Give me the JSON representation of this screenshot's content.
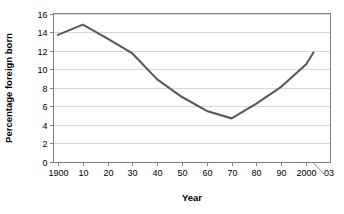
{
  "chart_data": {
    "type": "line",
    "title": "",
    "xlabel": "Year",
    "ylabel": "Percentage foreign born",
    "xlim": [
      1900,
      2003
    ],
    "ylim": [
      0,
      16
    ],
    "grid": "horizontal",
    "legend": "none",
    "x_tick_labels": [
      "1900",
      "10",
      "20",
      "30",
      "40",
      "50",
      "60",
      "70",
      "80",
      "90",
      "2000",
      "03"
    ],
    "x_tick_values": [
      1900,
      1910,
      1920,
      1930,
      1940,
      1950,
      1960,
      1970,
      1980,
      1990,
      2000,
      2003
    ],
    "y_tick_labels": [
      "0",
      "2",
      "4",
      "6",
      "8",
      "10",
      "12",
      "14",
      "16"
    ],
    "y_tick_values": [
      0,
      2,
      4,
      6,
      8,
      10,
      12,
      14,
      16
    ],
    "series": [
      {
        "name": "Percentage foreign born",
        "color": "#595959",
        "x": [
          1900,
          1910,
          1920,
          1930,
          1940,
          1950,
          1960,
          1970,
          1980,
          1990,
          2000,
          2003
        ],
        "values": [
          13.7,
          14.8,
          13.3,
          11.7,
          8.9,
          7.0,
          5.5,
          4.7,
          6.3,
          8.1,
          10.5,
          11.8
        ]
      }
    ],
    "annotations": [
      {
        "name": "year-2003-leader",
        "label": "03",
        "points_to_x": 2003
      }
    ]
  },
  "axis": {
    "y_title": "Percentage foreign born",
    "x_title": "Year"
  },
  "colors": {
    "line": "#595959",
    "gridline": "#d9d9d9",
    "border": "#808080",
    "background": "#ffffff",
    "text": "#000000"
  }
}
